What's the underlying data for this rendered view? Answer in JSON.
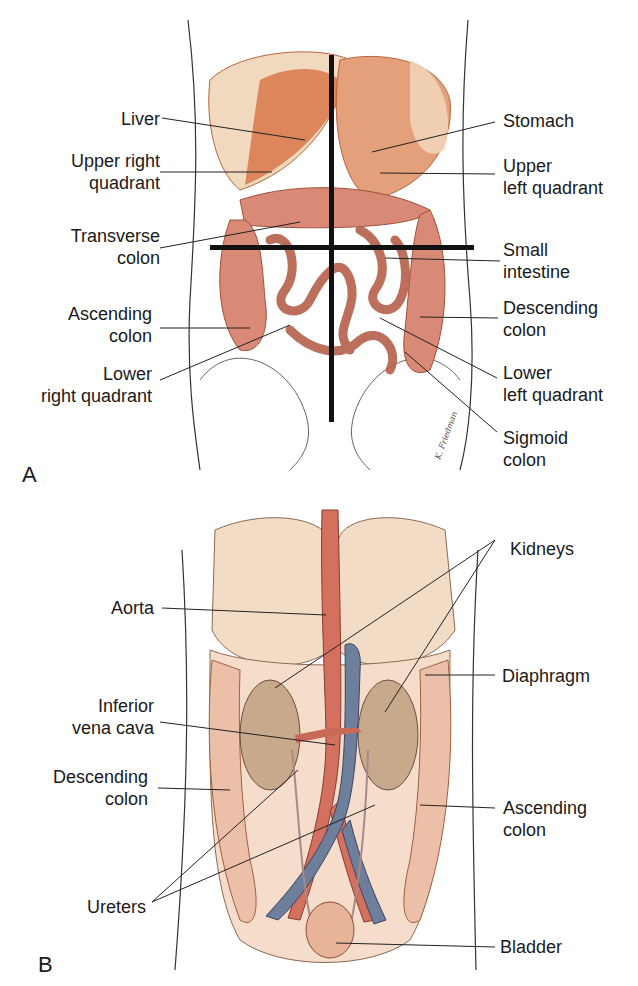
{
  "panel_a": {
    "letter": "A",
    "labels_left": [
      {
        "lines": [
          "Liver"
        ]
      },
      {
        "lines": [
          "Upper right",
          "quadrant"
        ]
      },
      {
        "lines": [
          "Transverse",
          "colon"
        ]
      },
      {
        "lines": [
          "Ascending",
          "colon"
        ]
      },
      {
        "lines": [
          "Lower",
          "right quadrant"
        ]
      }
    ],
    "labels_right": [
      {
        "lines": [
          "Stomach"
        ]
      },
      {
        "lines": [
          "Upper",
          "left quadrant"
        ]
      },
      {
        "lines": [
          "Small",
          "intestine"
        ]
      },
      {
        "lines": [
          "Descending",
          "colon"
        ]
      },
      {
        "lines": [
          "Lower",
          "left quadrant"
        ]
      },
      {
        "lines": [
          "Sigmoid",
          "colon"
        ]
      }
    ]
  },
  "panel_b": {
    "letter": "B",
    "labels_left": [
      {
        "lines": [
          "Aorta"
        ]
      },
      {
        "lines": [
          "Inferior",
          "vena cava"
        ]
      },
      {
        "lines": [
          "Descending",
          "colon"
        ]
      },
      {
        "lines": [
          "Ureters"
        ]
      }
    ],
    "labels_right": [
      {
        "lines": [
          "Kidneys"
        ]
      },
      {
        "lines": [
          "Diaphragm"
        ]
      },
      {
        "lines": [
          "Ascending",
          "colon"
        ]
      },
      {
        "lines": [
          "Bladder"
        ]
      }
    ]
  },
  "colors": {
    "organ_orange": "#d9774a",
    "intestine_pink": "#d98a76",
    "liver_cream": "#f1d9bf",
    "aorta_red": "#d4705e",
    "vena_cava_blue": "#6e7f9c",
    "kidney_tan": "#c9a98c"
  }
}
